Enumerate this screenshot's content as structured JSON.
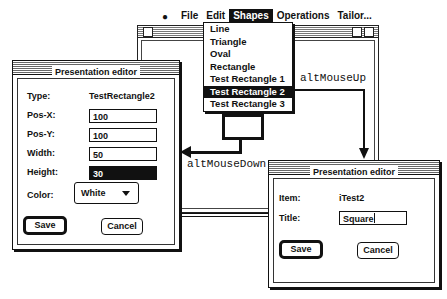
{
  "menubar": {
    "apple_icon": "",
    "items": [
      {
        "label": "File",
        "active": false
      },
      {
        "label": "Edit",
        "active": false
      },
      {
        "label": "Shapes",
        "active": true
      },
      {
        "label": "Operations",
        "active": false
      },
      {
        "label": "Tailor...",
        "active": false
      }
    ]
  },
  "shapes_menu": {
    "items": [
      {
        "label": "Line",
        "selected": false
      },
      {
        "label": "Triangle",
        "selected": false
      },
      {
        "label": "Oval",
        "selected": false
      },
      {
        "label": "Rectangle",
        "selected": false
      },
      {
        "label": "Test Rectangle 1",
        "selected": false
      },
      {
        "label": "Test Rectangle 2",
        "selected": true
      },
      {
        "label": "Test Rectangle 3",
        "selected": false
      }
    ]
  },
  "annotations": {
    "mouse_up": "altMouseUp",
    "mouse_down": "altMouseDown"
  },
  "left_editor": {
    "title": "Presentation editor",
    "type_label": "Type:",
    "type_value": "TestRectangle2",
    "posx_label": "Pos-X:",
    "posx_value": "100",
    "posy_label": "Pos-Y:",
    "posy_value": "100",
    "width_label": "Width:",
    "width_value": "50",
    "height_label": "Height:",
    "height_value": "30",
    "color_label": "Color:",
    "color_value": "White",
    "save_label": "Save",
    "cancel_label": "Cancel"
  },
  "right_editor": {
    "title": "Presentation editor",
    "item_label": "Item:",
    "item_value": "iTest2",
    "title_label": "Title:",
    "title_value": "Square",
    "save_label": "Save",
    "cancel_label": "Cancel"
  }
}
